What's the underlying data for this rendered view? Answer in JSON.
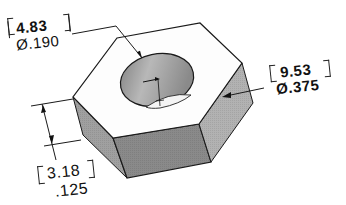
{
  "diagram": {
    "type": "isometric hex nut with dimensions",
    "colors": {
      "background": "#ffffff",
      "top_face": "#fdfdfd",
      "front_face": "#8c8c8c",
      "left_face": "#a4a4a4",
      "right_face": "#b4b4b4",
      "hole": "#9a9a9a",
      "outline": "#1a1a1a"
    },
    "dimensions": {
      "hole_diameter": {
        "metric": "4.83",
        "imperial": "Ø.190"
      },
      "across_flats": {
        "metric": "9.53",
        "imperial": "Ø.375"
      },
      "thickness": {
        "metric": "3.18",
        "imperial": ".125"
      }
    }
  }
}
